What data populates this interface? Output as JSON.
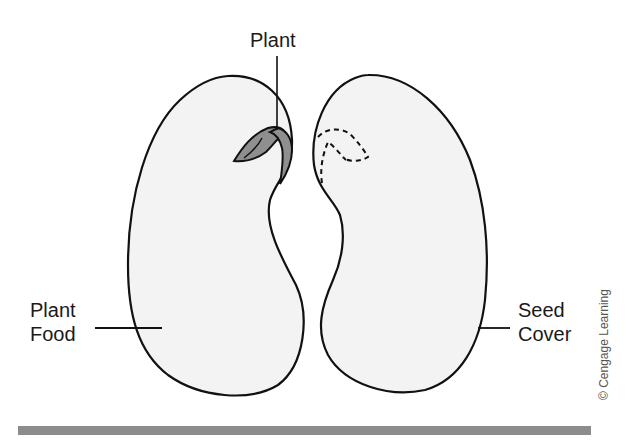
{
  "diagram": {
    "labels": {
      "plant": "Plant",
      "plant_food_line1": "Plant",
      "plant_food_line2": "Food",
      "seed_cover_line1": "Seed",
      "seed_cover_line2": "Cover"
    },
    "copyright": "© Cengage Learning",
    "colors": {
      "seed_fill": "#f3f3f3",
      "outline": "#111111",
      "embryo_fill": "#8f8f8f",
      "bottom_bar": "#8c8c8c"
    }
  }
}
